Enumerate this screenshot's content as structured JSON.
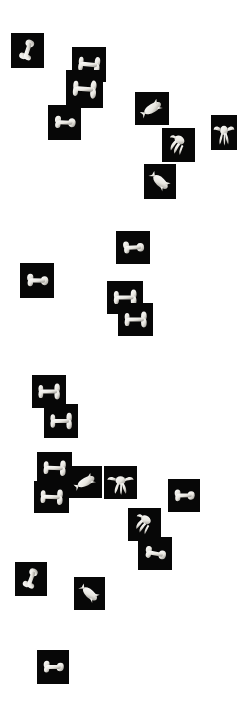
{
  "view": {
    "title": "Object thumbnail embedding scatter",
    "background_color": "#ffffff",
    "tile_background_color": "#070707",
    "object_color": "#e8e6e0",
    "width": 237,
    "height": 705
  },
  "chart_data": {
    "type": "scatter",
    "xlabel": "",
    "ylabel": "",
    "xlim": [
      0,
      237
    ],
    "ylim": [
      0,
      705
    ],
    "grid": false,
    "legend": null,
    "tick_labels": [],
    "annotations": [],
    "marker_type": "image-thumbnail",
    "points": [
      {
        "id": "t01",
        "x": 11,
        "y": 33,
        "w": 33,
        "h": 35,
        "shape": "femur-diagonal",
        "rotation": -32,
        "label": "bone-femur"
      },
      {
        "id": "t02",
        "x": 72,
        "y": 47,
        "w": 34,
        "h": 35,
        "shape": "bone-horizontal",
        "rotation": 6,
        "label": "bone-long"
      },
      {
        "id": "t03",
        "x": 66,
        "y": 70,
        "w": 37,
        "h": 38,
        "shape": "bone-horizontal",
        "rotation": 4,
        "label": "bone-long"
      },
      {
        "id": "t04",
        "x": 48,
        "y": 105,
        "w": 33,
        "h": 35,
        "shape": "femur-diagonal",
        "rotation": 42,
        "label": "bone-femur"
      },
      {
        "id": "t05",
        "x": 135,
        "y": 92,
        "w": 34,
        "h": 33,
        "shape": "vertebra",
        "rotation": -14,
        "label": "vertebra"
      },
      {
        "id": "t06",
        "x": 162,
        "y": 128,
        "w": 33,
        "h": 34,
        "shape": "claw-hand",
        "rotation": 16,
        "label": "hand-bones"
      },
      {
        "id": "t07",
        "x": 211,
        "y": 115,
        "w": 26,
        "h": 35,
        "shape": "hand-open",
        "rotation": 0,
        "label": "hand-open"
      },
      {
        "id": "t08",
        "x": 144,
        "y": 164,
        "w": 32,
        "h": 35,
        "shape": "vertebra",
        "rotation": 64,
        "label": "vertebra"
      },
      {
        "id": "t09",
        "x": 116,
        "y": 231,
        "w": 34,
        "h": 33,
        "shape": "femur-diagonal",
        "rotation": 35,
        "label": "bone-femur"
      },
      {
        "id": "t10",
        "x": 20,
        "y": 263,
        "w": 34,
        "h": 35,
        "shape": "femur-diagonal",
        "rotation": 40,
        "label": "bone-femur"
      },
      {
        "id": "t11",
        "x": 107,
        "y": 281,
        "w": 36,
        "h": 33,
        "shape": "bone-horizontal",
        "rotation": 0,
        "label": "bone-long"
      },
      {
        "id": "t12",
        "x": 118,
        "y": 303,
        "w": 35,
        "h": 33,
        "shape": "bone-horizontal",
        "rotation": 0,
        "label": "bone-long"
      },
      {
        "id": "t13",
        "x": 32,
        "y": 375,
        "w": 34,
        "h": 33,
        "shape": "bone-horizontal",
        "rotation": 0,
        "label": "bone-long"
      },
      {
        "id": "t14",
        "x": 44,
        "y": 404,
        "w": 34,
        "h": 34,
        "shape": "bone-horizontal",
        "rotation": 0,
        "label": "bone-long"
      },
      {
        "id": "t15",
        "x": 37,
        "y": 452,
        "w": 35,
        "h": 32,
        "shape": "bone-horizontal",
        "rotation": 2,
        "label": "bone-long"
      },
      {
        "id": "t16",
        "x": 69,
        "y": 466,
        "w": 33,
        "h": 32,
        "shape": "vertebra",
        "rotation": -10,
        "label": "vertebra"
      },
      {
        "id": "t17",
        "x": 34,
        "y": 481,
        "w": 35,
        "h": 32,
        "shape": "bone-horizontal",
        "rotation": 2,
        "label": "bone-long"
      },
      {
        "id": "t18",
        "x": 104,
        "y": 466,
        "w": 33,
        "h": 33,
        "shape": "hand-open",
        "rotation": 0,
        "label": "hand-open"
      },
      {
        "id": "t19",
        "x": 168,
        "y": 479,
        "w": 32,
        "h": 33,
        "shape": "femur-diagonal",
        "rotation": 38,
        "label": "bone-femur"
      },
      {
        "id": "t20",
        "x": 128,
        "y": 508,
        "w": 33,
        "h": 33,
        "shape": "claw-hand",
        "rotation": 22,
        "label": "hand-bones"
      },
      {
        "id": "t21",
        "x": 138,
        "y": 537,
        "w": 34,
        "h": 33,
        "shape": "femur-diagonal",
        "rotation": 48,
        "label": "bone-femur"
      },
      {
        "id": "t22",
        "x": 15,
        "y": 562,
        "w": 32,
        "h": 34,
        "shape": "femur-diagonal",
        "rotation": -30,
        "label": "bone-femur"
      },
      {
        "id": "t23",
        "x": 74,
        "y": 577,
        "w": 31,
        "h": 33,
        "shape": "vertebra",
        "rotation": 62,
        "label": "vertebra"
      },
      {
        "id": "t24",
        "x": 37,
        "y": 650,
        "w": 32,
        "h": 34,
        "shape": "femur-diagonal",
        "rotation": 40,
        "label": "bone-femur"
      }
    ]
  }
}
